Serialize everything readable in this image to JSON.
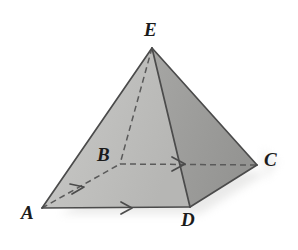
{
  "figure": {
    "type": "geometry-diagram",
    "shape_name": "square-pyramid",
    "background_color": "#ffffff",
    "vertices": [
      {
        "id": "E",
        "label": "E",
        "x": 152,
        "y": 48,
        "role": "apex",
        "hidden": false
      },
      {
        "id": "A",
        "label": "A",
        "x": 42,
        "y": 208,
        "role": "base-corner",
        "hidden": false
      },
      {
        "id": "B",
        "label": "B",
        "x": 120,
        "y": 164,
        "role": "base-corner",
        "hidden": true
      },
      {
        "id": "C",
        "label": "C",
        "x": 257,
        "y": 165,
        "role": "base-corner",
        "hidden": false
      },
      {
        "id": "D",
        "label": "D",
        "x": 190,
        "y": 207,
        "role": "base-corner",
        "hidden": false
      }
    ],
    "edges": [
      {
        "id": "AE",
        "from": "A",
        "to": "E",
        "style": "solid",
        "marker": "none"
      },
      {
        "id": "EC",
        "from": "E",
        "to": "C",
        "style": "solid",
        "marker": "none"
      },
      {
        "id": "ED",
        "from": "E",
        "to": "D",
        "style": "solid",
        "marker": "none"
      },
      {
        "id": "EB",
        "from": "E",
        "to": "B",
        "style": "dashed",
        "marker": "none"
      },
      {
        "id": "AD",
        "from": "A",
        "to": "D",
        "style": "solid",
        "marker": "single-arrow"
      },
      {
        "id": "DC",
        "from": "D",
        "to": "C",
        "style": "solid",
        "marker": "none"
      },
      {
        "id": "AB",
        "from": "A",
        "to": "B",
        "style": "dashed",
        "marker": "single-arrow"
      },
      {
        "id": "BC",
        "from": "B",
        "to": "C",
        "style": "dashed",
        "marker": "single-arrow"
      }
    ],
    "faces": [
      {
        "id": "AEB",
        "vertices": "A,E,B",
        "fill": "#e3e3e1",
        "name": "left-face"
      },
      {
        "id": "AED",
        "vertices": "A,E,D",
        "fill": "#c2c2c0",
        "name": "front-face"
      },
      {
        "id": "EDC",
        "vertices": "E,D,C",
        "fill": "#9d9d9b",
        "name": "right-face"
      },
      {
        "id": "ABD",
        "vertices": "A,B,D",
        "fill": "#c9c9c7",
        "name": "base-front-triangle"
      },
      {
        "id": "BDC",
        "vertices": "B,D,C",
        "fill": "#a3a3a1",
        "name": "base-right-triangle"
      }
    ],
    "edge_color": "#4b4b4b",
    "label_color": "#1b1b1b",
    "markers": [
      {
        "id": "marker-AD",
        "on_edge": "AD",
        "x": 128,
        "y": 208,
        "glyph": "arrow-chevron"
      },
      {
        "id": "marker-AB",
        "on_edge": "AB",
        "x": 79,
        "y": 188,
        "glyph": "arrow-chevron"
      },
      {
        "id": "marker-BC",
        "on_edge": "BC",
        "x": 182,
        "y": 164,
        "glyph": "arrow-chevron"
      }
    ],
    "labels": {
      "E": "E",
      "A": "A",
      "B": "B",
      "C": "C",
      "D": "D"
    }
  }
}
